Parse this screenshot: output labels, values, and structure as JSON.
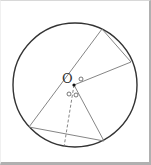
{
  "diagram": {
    "type": "geometry-circle",
    "center_label": "O",
    "circle": {
      "cx": 75,
      "cy": 85,
      "r": 62
    },
    "center": {
      "x": 74,
      "y": 85
    },
    "points": {
      "A": {
        "x": 102,
        "y": 29
      },
      "B": {
        "x": 131,
        "y": 62
      },
      "C": {
        "x": 29,
        "y": 127
      },
      "D": {
        "x": 104,
        "y": 141
      },
      "E": {
        "x": 64,
        "y": 147
      }
    },
    "segments": [
      {
        "from": "A",
        "to": "C",
        "style": "solid",
        "note": "diameter through O"
      },
      {
        "from": "A",
        "to": "B",
        "style": "solid",
        "note": "chord"
      },
      {
        "from": "O",
        "to": "B",
        "style": "solid"
      },
      {
        "from": "O",
        "to": "D",
        "style": "solid"
      },
      {
        "from": "C",
        "to": "D",
        "style": "solid",
        "note": "chord"
      },
      {
        "from": "O",
        "to": "E",
        "style": "dashed"
      }
    ],
    "angle_marks": [
      {
        "near": "O",
        "between": [
          "OA",
          "OB"
        ],
        "symbol": "circle"
      },
      {
        "near": "O",
        "between": [
          "OC",
          "OE"
        ],
        "symbol": "circle"
      },
      {
        "near": "O",
        "between": [
          "OE",
          "OD"
        ],
        "symbol": "circle"
      }
    ],
    "colors": {
      "circle": "#333333",
      "lines": "#777777",
      "marks": "#555555"
    }
  }
}
